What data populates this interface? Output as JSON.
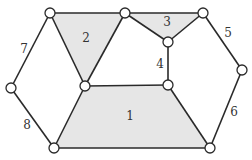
{
  "diagram": {
    "type": "planar-graph",
    "colors": {
      "face_fill": "#e6e6e6",
      "edge": "#2a2a2a",
      "node_fill": "#ffffff",
      "label": "#333333"
    },
    "nodes": [
      {
        "id": "A",
        "x": 50,
        "y": 13
      },
      {
        "id": "B",
        "x": 125,
        "y": 13
      },
      {
        "id": "C",
        "x": 203,
        "y": 13
      },
      {
        "id": "D",
        "x": 168,
        "y": 42
      },
      {
        "id": "E",
        "x": 242,
        "y": 70
      },
      {
        "id": "F",
        "x": 11,
        "y": 88
      },
      {
        "id": "G",
        "x": 85,
        "y": 86
      },
      {
        "id": "H",
        "x": 168,
        "y": 85
      },
      {
        "id": "I",
        "x": 54,
        "y": 148
      },
      {
        "id": "J",
        "x": 210,
        "y": 148
      }
    ],
    "edges": [
      [
        "A",
        "B"
      ],
      [
        "A",
        "G"
      ],
      [
        "B",
        "G"
      ],
      [
        "B",
        "C"
      ],
      [
        "B",
        "D"
      ],
      [
        "C",
        "D"
      ],
      [
        "D",
        "H"
      ],
      [
        "C",
        "E"
      ],
      [
        "E",
        "J"
      ],
      [
        "A",
        "F"
      ],
      [
        "F",
        "I"
      ],
      [
        "G",
        "H"
      ],
      [
        "H",
        "J"
      ],
      [
        "J",
        "I"
      ],
      [
        "I",
        "G"
      ]
    ],
    "faces": [
      {
        "label": "1",
        "points": "85,86 168,85 210,148 54,148",
        "label_x": 130,
        "label_y": 116
      },
      {
        "label": "2",
        "points": "50,13 125,13 85,86",
        "label_x": 86,
        "label_y": 38
      },
      {
        "label": "3",
        "points": "125,13 203,13 168,42",
        "label_x": 167,
        "label_y": 22
      }
    ],
    "edge_labels": [
      {
        "text": "4",
        "x": 160,
        "y": 64
      },
      {
        "text": "5",
        "x": 228,
        "y": 33
      },
      {
        "text": "6",
        "x": 234,
        "y": 112
      },
      {
        "text": "7",
        "x": 24,
        "y": 49
      },
      {
        "text": "8",
        "x": 27,
        "y": 125
      }
    ]
  }
}
